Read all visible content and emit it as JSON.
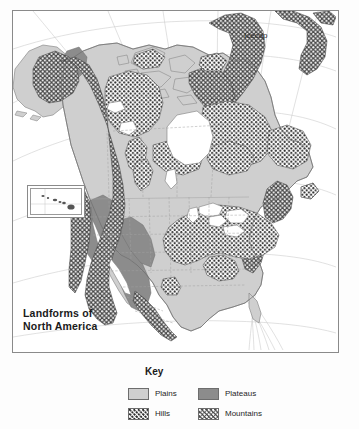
{
  "map": {
    "title": "Landforms of\nNorth America",
    "annotations": [
      {
        "name": "icecap",
        "text": "Icecap"
      }
    ],
    "inset": {
      "name": "hawaii-inset"
    },
    "colors": {
      "plains": "#cfcfcf",
      "plateaus": "#8c8c8c",
      "hills_fill": "#ffffff",
      "hills_dots": "#2e2e2e",
      "mountains_fill": "#4a4a4a",
      "mountains_dots": "#ffffff",
      "water": "#ffffff",
      "border": "#8a8a8a",
      "graticule": "#c8c8c8",
      "political": "#9b9b9b"
    }
  },
  "key": {
    "title": "Key",
    "items": [
      {
        "label": "Plains",
        "swatch": "plains-swatch"
      },
      {
        "label": "Plateaus",
        "swatch": "plateaus-swatch"
      },
      {
        "label": "Hills",
        "swatch": "hills-swatch"
      },
      {
        "label": "Mountains",
        "swatch": "mountains-swatch"
      }
    ]
  }
}
